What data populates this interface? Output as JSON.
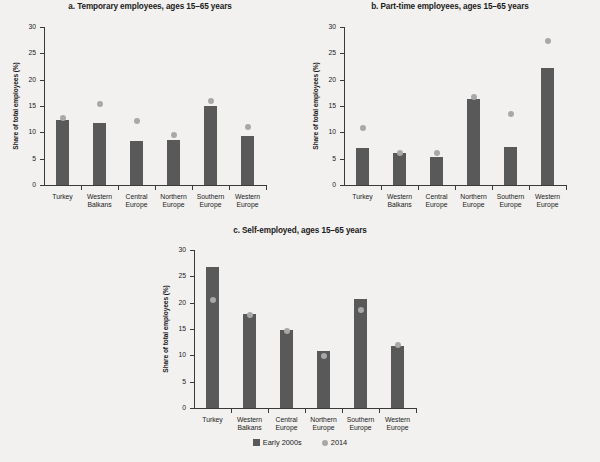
{
  "figure": {
    "ylabel": "Share of total employees (%)",
    "y_ticks": [
      "0",
      "5",
      "10",
      "15",
      "20",
      "25",
      "30"
    ],
    "legend": {
      "items": [
        {
          "label": "Early 2000s",
          "marker": "bar-swatch",
          "color": "#595959"
        },
        {
          "label": "2014",
          "marker": "dot-swatch",
          "color": "#a8a8a8"
        }
      ]
    },
    "colors": {
      "bar": "#595959",
      "dot": "#a8a8a8",
      "axis": "#3a3a3a",
      "background": "#f2f1ef"
    }
  },
  "chart_data": [
    {
      "type": "bar",
      "panel": "a",
      "title": "a. Temporary employees, ages 15–65 years",
      "xlabel": "",
      "ylabel": "Share of total employees (%)",
      "ylim": [
        0,
        30
      ],
      "categories": [
        "Turkey",
        "Western Balkans",
        "Central Europe",
        "Northern Europe",
        "Southern Europe",
        "Western Europe"
      ],
      "series": [
        {
          "name": "Early 2000s",
          "type": "bar",
          "values": [
            12.3,
            11.8,
            8.3,
            8.6,
            15.0,
            9.3
          ]
        },
        {
          "name": "2014",
          "type": "scatter",
          "values": [
            12.8,
            15.3,
            12.2,
            9.5,
            16.0,
            11.0
          ]
        }
      ],
      "grid": false
    },
    {
      "type": "bar",
      "panel": "b",
      "title": "b. Part-time employees, ages 15–65 years",
      "xlabel": "",
      "ylabel": "Share of total employees (%)",
      "ylim": [
        0,
        30
      ],
      "categories": [
        "Turkey",
        "Western Balkans",
        "Central Europe",
        "Northern Europe",
        "Southern Europe",
        "Western Europe"
      ],
      "series": [
        {
          "name": "Early 2000s",
          "type": "bar",
          "values": [
            7.1,
            6.1,
            5.4,
            16.3,
            7.2,
            22.3
          ]
        },
        {
          "name": "2014",
          "type": "scatter",
          "values": [
            10.9,
            6.0,
            6.1,
            16.8,
            13.5,
            27.3
          ]
        }
      ],
      "grid": false
    },
    {
      "type": "bar",
      "panel": "c",
      "title": "c. Self-employed, ages 15–65 years",
      "xlabel": "",
      "ylabel": "Share of total employees (%)",
      "ylim": [
        0,
        30
      ],
      "categories": [
        "Turkey",
        "Western Balkans",
        "Central Europe",
        "Northern Europe",
        "Southern Europe",
        "Western Europe"
      ],
      "series": [
        {
          "name": "Early 2000s",
          "type": "bar",
          "values": [
            26.7,
            17.8,
            14.9,
            10.8,
            20.7,
            11.7
          ]
        },
        {
          "name": "2014",
          "type": "scatter",
          "values": [
            20.5,
            17.7,
            14.7,
            9.8,
            18.7,
            11.9
          ]
        }
      ],
      "grid": false
    }
  ]
}
